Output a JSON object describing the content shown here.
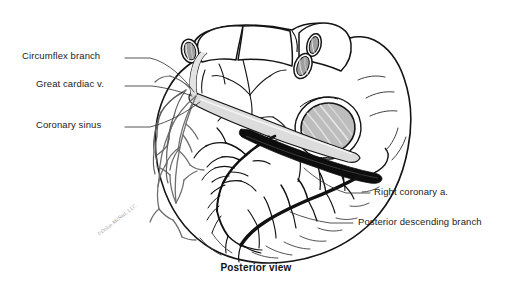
{
  "figure": {
    "caption": "Posterior view",
    "watermark": "©Dolan McNeil, LLC",
    "background_color": "#ffffff",
    "ink_color": "#141414",
    "vein_fill_color": "#d9d9d9",
    "shadow_color": "#8a8a8a"
  },
  "labels": {
    "left": [
      {
        "id": "circumflex-branch",
        "text": "Circumflex branch",
        "x": 22,
        "y": 55,
        "leader": "from label right edge to vessel at upper-left atrioventricular groove"
      },
      {
        "id": "great-cardiac-vein",
        "text": "Great cardiac v.",
        "x": 36,
        "y": 83,
        "leader": "from label right edge to pale vein in atrioventricular groove"
      },
      {
        "id": "coronary-sinus",
        "text": "Coronary sinus",
        "x": 36,
        "y": 124,
        "leader": "from label right edge to wide pale sinus in posterior groove"
      }
    ],
    "right": [
      {
        "id": "right-coronary-artery",
        "text": "Right coronary a.",
        "x": 374,
        "y": 193,
        "leader": "from label left edge up to dark artery in right atrioventricular groove"
      },
      {
        "id": "posterior-descending-branch",
        "text": "Posterior descending branch",
        "x": 358,
        "y": 223,
        "leader": "from label left edge to dark artery descending toward apex"
      }
    ]
  },
  "anatomy": {
    "structures": [
      "great vessels at superior aspect",
      "superior vena cava orifice",
      "pulmonary vein orifices",
      "inferior vena cava orifice",
      "left atrium",
      "left ventricle",
      "right ventricle",
      "coronary sinus",
      "great cardiac vein",
      "circumflex branch of left coronary artery",
      "right coronary artery",
      "posterior descending branch",
      "middle cardiac vein",
      "cardiac apex"
    ]
  }
}
